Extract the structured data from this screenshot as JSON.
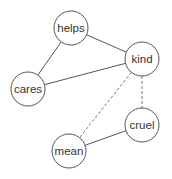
{
  "diagram": {
    "type": "undirected-graph",
    "nodes": [
      {
        "id": "helps",
        "label": "helps",
        "x": 71,
        "y": 28,
        "r": 17
      },
      {
        "id": "kind",
        "label": "kind",
        "x": 142,
        "y": 59,
        "r": 17
      },
      {
        "id": "cares",
        "label": "cares",
        "x": 28,
        "y": 89,
        "r": 17
      },
      {
        "id": "cruel",
        "label": "cruel",
        "x": 142,
        "y": 125,
        "r": 17
      },
      {
        "id": "mean",
        "label": "mean",
        "x": 69,
        "y": 151,
        "r": 17
      }
    ],
    "edges": [
      {
        "from": "helps",
        "to": "kind",
        "style": "solid"
      },
      {
        "from": "helps",
        "to": "cares",
        "style": "solid"
      },
      {
        "from": "cares",
        "to": "kind",
        "style": "solid"
      },
      {
        "from": "kind",
        "to": "cruel",
        "style": "dashed"
      },
      {
        "from": "kind",
        "to": "mean",
        "style": "dashed"
      },
      {
        "from": "mean",
        "to": "cruel",
        "style": "solid"
      }
    ]
  }
}
